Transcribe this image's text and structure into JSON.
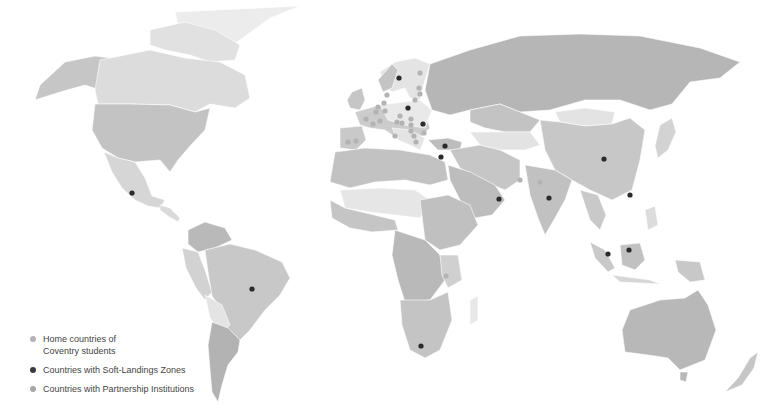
{
  "title_strip": {
    "left": "",
    "right": ""
  },
  "colors": {
    "background": "#ffffff",
    "land_light": "#e3e3e3",
    "land_mid": "#cfcfcf",
    "land_dark": "#b5b5b5",
    "land_darker": "#a6a6a6",
    "home_dot": "#b3b3b3",
    "soft_landing_dot": "#2b2b2b",
    "partnership_dot": "#a8a8a8"
  },
  "legend": {
    "items": [
      {
        "label_line1": "Home countries of",
        "label_line2": "Coventry students",
        "color": "#b3b3b3"
      },
      {
        "label_line1": "Countries with Soft-Landings Zones",
        "label_line2": "",
        "color": "#3a3a3a"
      },
      {
        "label_line1": "Countries with Partnership Institutions",
        "label_line2": "",
        "color": "#a8a8a8"
      }
    ]
  },
  "markers": {
    "soft_landing": [
      {
        "name": "Mexico",
        "x": 132,
        "y": 193
      },
      {
        "name": "Brazil",
        "x": 252,
        "y": 289
      },
      {
        "name": "South Africa",
        "x": 421,
        "y": 346
      },
      {
        "name": "Sweden",
        "x": 399,
        "y": 78
      },
      {
        "name": "Poland",
        "x": 408,
        "y": 108
      },
      {
        "name": "Romania",
        "x": 423,
        "y": 124
      },
      {
        "name": "Turkey",
        "x": 445,
        "y": 146
      },
      {
        "name": "Israel",
        "x": 441,
        "y": 157
      },
      {
        "name": "Oman",
        "x": 499,
        "y": 199
      },
      {
        "name": "India",
        "x": 549,
        "y": 198
      },
      {
        "name": "China",
        "x": 604,
        "y": 159
      },
      {
        "name": "Hong Kong",
        "x": 630,
        "y": 195
      },
      {
        "name": "Malaysia",
        "x": 608,
        "y": 254
      },
      {
        "name": "Brunei",
        "x": 629,
        "y": 250
      }
    ],
    "home": [
      {
        "x": 420,
        "y": 73
      },
      {
        "x": 419,
        "y": 88
      },
      {
        "x": 420,
        "y": 94
      },
      {
        "x": 415,
        "y": 100
      },
      {
        "x": 387,
        "y": 95
      },
      {
        "x": 384,
        "y": 103
      },
      {
        "x": 378,
        "y": 107
      },
      {
        "x": 376,
        "y": 112
      },
      {
        "x": 385,
        "y": 111
      },
      {
        "x": 366,
        "y": 119
      },
      {
        "x": 380,
        "y": 121
      },
      {
        "x": 400,
        "y": 116
      },
      {
        "x": 397,
        "y": 122
      },
      {
        "x": 402,
        "y": 123
      },
      {
        "x": 411,
        "y": 119
      },
      {
        "x": 411,
        "y": 125
      },
      {
        "x": 411,
        "y": 131
      },
      {
        "x": 414,
        "y": 136
      },
      {
        "x": 424,
        "y": 133
      },
      {
        "x": 395,
        "y": 136
      },
      {
        "x": 416,
        "y": 142
      },
      {
        "x": 348,
        "y": 142
      },
      {
        "x": 356,
        "y": 141
      },
      {
        "x": 373,
        "y": 124
      },
      {
        "x": 520,
        "y": 180
      },
      {
        "x": 540,
        "y": 182
      },
      {
        "x": 446,
        "y": 276
      }
    ]
  }
}
